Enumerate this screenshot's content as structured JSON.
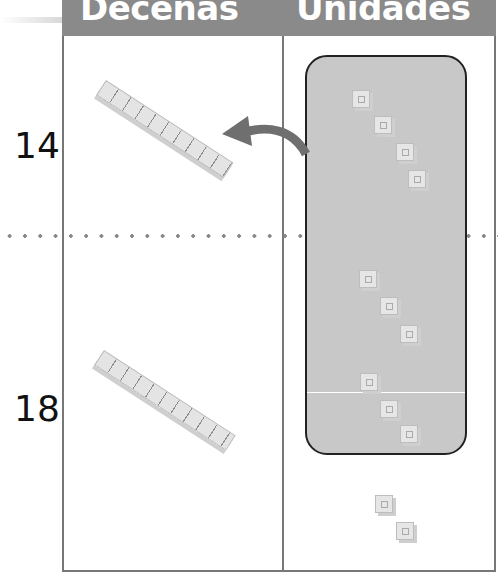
{
  "header": {
    "tens_label": "Decenas",
    "units_label": "Unidades"
  },
  "rows": [
    {
      "number": "14",
      "tens_rods": 1,
      "units_in_group": 4
    },
    {
      "number": "18",
      "tens_rods": 1,
      "units_in_group": 6,
      "loose_units": 2
    }
  ],
  "colors": {
    "header_bg": "#8a8a8a",
    "group_bg": "#c8c8c8",
    "arrow": "#6f6f6f",
    "grid": "#777777"
  }
}
